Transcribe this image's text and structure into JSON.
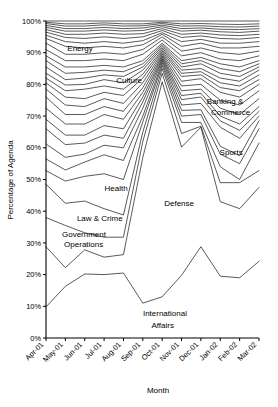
{
  "chart_data": {
    "type": "area",
    "title": "",
    "xlabel": "Month",
    "ylabel": "Percentage of Agenda",
    "grid": false,
    "legend_position": "inline-annotations",
    "ylim": [
      0,
      100
    ],
    "ytick_labels": [
      "0%",
      "10%",
      "20%",
      "30%",
      "40%",
      "50%",
      "60%",
      "70%",
      "80%",
      "90%",
      "100%"
    ],
    "ytick_values": [
      0,
      10,
      20,
      30,
      40,
      50,
      60,
      70,
      80,
      90,
      100
    ],
    "categories": [
      "Apr-01",
      "May-01",
      "Jun-01",
      "Jul-01",
      "Aug-01",
      "Sep-01",
      "Oct-01",
      "Nov-01",
      "Dec-01",
      "Jan-02",
      "Feb-02",
      "Mar-02"
    ],
    "stacking": "cumulative-percentage",
    "annotations": [
      {
        "text": "Energy",
        "x_frac": 0.1,
        "y_pct": 90.5
      },
      {
        "text": "Culture",
        "x_frac": 0.33,
        "y_pct": 80.5
      },
      {
        "text": "Banking &",
        "x_frac": 0.755,
        "y_pct": 73.8
      },
      {
        "text": "Commerce",
        "x_frac": 0.775,
        "y_pct": 70.5
      },
      {
        "text": "Sports",
        "x_frac": 0.815,
        "y_pct": 57.8
      },
      {
        "text": "Health",
        "x_frac": 0.275,
        "y_pct": 46.5
      },
      {
        "text": "Defense",
        "x_frac": 0.555,
        "y_pct": 41.5
      },
      {
        "text": "Law & Crime",
        "x_frac": 0.145,
        "y_pct": 37.0
      },
      {
        "text": "Government",
        "x_frac": 0.075,
        "y_pct": 32.0
      },
      {
        "text": "Operations",
        "x_frac": 0.085,
        "y_pct": 28.8
      },
      {
        "text": "International",
        "x_frac": 0.455,
        "y_pct": 7.0
      },
      {
        "text": "Affairs",
        "x_frac": 0.495,
        "y_pct": 3.3
      }
    ],
    "series": [
      {
        "name": "International Affairs",
        "values": [
          9.8,
          16.3,
          20.2,
          20.0,
          20.5,
          11.0,
          13.0,
          19.8,
          28.8,
          19.5,
          19.0,
          24.2
        ]
      },
      {
        "name": "Defense (cum.)",
        "values": [
          28.8,
          22.2,
          27.8,
          25.5,
          26.3,
          57.0,
          80.8,
          60.2,
          66.5,
          43.0,
          40.8,
          47.5
        ]
      },
      {
        "name": "Government Operations (cum.)",
        "values": [
          38.0,
          35.5,
          33.2,
          31.8,
          31.8,
          62.0,
          83.5,
          64.5,
          66.8,
          49.0,
          49.0,
          52.8
        ]
      },
      {
        "name": "Law & Crime (cum.)",
        "values": [
          48.5,
          42.5,
          43.2,
          40.8,
          38.8,
          65.0,
          85.0,
          68.0,
          68.0,
          54.0,
          50.0,
          61.5
        ]
      },
      {
        "name": "Health (cum.)",
        "values": [
          52.8,
          49.5,
          51.0,
          51.8,
          50.0,
          68.2,
          86.0,
          70.0,
          70.5,
          58.0,
          55.0,
          66.0
        ]
      },
      {
        "name": "Sports (cum.)",
        "values": [
          56.5,
          53.0,
          55.5,
          57.8,
          56.0,
          70.0,
          86.8,
          71.8,
          72.0,
          60.5,
          57.5,
          68.5
        ]
      },
      {
        "name": "Banking & Commerce (cum.)",
        "values": [
          61.2,
          57.0,
          58.0,
          60.8,
          60.0,
          72.5,
          87.5,
          73.5,
          74.0,
          66.5,
          63.0,
          70.0
        ]
      },
      {
        "name": "Series 8",
        "values": [
          66.0,
          61.0,
          61.5,
          64.0,
          63.0,
          74.5,
          88.0,
          75.2,
          76.0,
          68.5,
          65.5,
          71.5
        ]
      },
      {
        "name": "Series 9",
        "values": [
          69.0,
          64.0,
          64.0,
          67.0,
          66.0,
          76.0,
          88.5,
          76.5,
          77.2,
          70.0,
          67.5,
          73.0
        ]
      },
      {
        "name": "Series 10",
        "values": [
          72.5,
          67.5,
          67.5,
          70.5,
          69.0,
          77.5,
          89.0,
          78.0,
          78.5,
          72.5,
          70.5,
          75.5
        ]
      },
      {
        "name": "Series 11",
        "values": [
          76.0,
          70.5,
          70.5,
          73.0,
          71.5,
          79.0,
          89.5,
          79.5,
          80.0,
          75.0,
          73.5,
          78.0
        ]
      },
      {
        "name": "Series 12",
        "values": [
          78.5,
          73.5,
          73.0,
          75.5,
          74.0,
          80.5,
          90.0,
          81.0,
          81.8,
          77.5,
          76.0,
          80.0
        ]
      },
      {
        "name": "Culture (cum.)",
        "values": [
          80.5,
          76.0,
          75.5,
          77.5,
          76.5,
          82.0,
          90.5,
          82.5,
          83.0,
          79.0,
          78.0,
          81.5
        ]
      },
      {
        "name": "Series 14",
        "values": [
          82.0,
          78.0,
          78.5,
          79.5,
          78.5,
          83.2,
          91.0,
          83.5,
          84.0,
          80.5,
          79.5,
          83.0
        ]
      },
      {
        "name": "Series 15",
        "values": [
          83.5,
          79.8,
          80.0,
          81.5,
          80.5,
          84.5,
          91.5,
          84.5,
          85.0,
          82.0,
          81.0,
          84.5
        ]
      },
      {
        "name": "Series 16",
        "values": [
          85.5,
          81.5,
          82.0,
          83.0,
          82.5,
          85.5,
          92.0,
          85.5,
          86.5,
          83.5,
          82.5,
          85.5
        ]
      },
      {
        "name": "Energy (cum.)",
        "values": [
          87.5,
          83.5,
          83.8,
          84.5,
          84.0,
          86.5,
          92.5,
          86.5,
          87.5,
          85.0,
          84.0,
          86.5
        ]
      },
      {
        "name": "Series 18",
        "values": [
          89.0,
          85.5,
          85.5,
          86.0,
          85.5,
          87.5,
          93.0,
          87.5,
          88.5,
          86.5,
          85.5,
          87.5
        ]
      },
      {
        "name": "Series 19",
        "values": [
          91.0,
          87.5,
          87.5,
          88.0,
          87.5,
          89.5,
          94.0,
          89.0,
          90.0,
          88.0,
          87.5,
          89.0
        ]
      },
      {
        "name": "Series 20",
        "values": [
          93.0,
          89.5,
          89.5,
          90.0,
          89.5,
          91.0,
          95.0,
          90.5,
          91.5,
          90.0,
          89.5,
          90.5
        ]
      },
      {
        "name": "Series 21",
        "values": [
          94.5,
          92.0,
          91.5,
          92.0,
          91.5,
          92.5,
          95.8,
          92.0,
          93.0,
          91.5,
          91.5,
          92.0
        ]
      },
      {
        "name": "Series 22",
        "values": [
          95.5,
          93.5,
          93.0,
          93.5,
          93.0,
          93.8,
          96.3,
          93.5,
          94.2,
          93.0,
          93.0,
          93.5
        ]
      },
      {
        "name": "Series 23",
        "values": [
          96.5,
          94.8,
          94.5,
          95.0,
          94.5,
          95.0,
          97.0,
          94.8,
          95.3,
          94.5,
          94.3,
          94.8
        ]
      },
      {
        "name": "Series 24",
        "values": [
          97.3,
          95.8,
          95.8,
          96.2,
          95.8,
          96.0,
          97.6,
          95.8,
          96.2,
          95.6,
          95.4,
          95.8
        ]
      },
      {
        "name": "Series 25",
        "values": [
          98.0,
          96.8,
          96.8,
          97.2,
          96.8,
          97.0,
          98.2,
          96.8,
          97.1,
          96.6,
          96.4,
          96.8
        ]
      },
      {
        "name": "Series 26",
        "values": [
          98.6,
          97.6,
          97.6,
          98.0,
          97.6,
          97.8,
          98.7,
          97.6,
          97.8,
          97.4,
          97.3,
          97.6
        ]
      },
      {
        "name": "Series 27",
        "values": [
          99.2,
          98.4,
          98.4,
          98.8,
          98.4,
          98.5,
          99.2,
          98.4,
          98.5,
          98.2,
          98.1,
          98.4
        ]
      },
      {
        "name": "Series 28",
        "values": [
          99.6,
          99.1,
          99.1,
          99.4,
          99.1,
          99.1,
          99.6,
          99.1,
          99.2,
          99.0,
          98.9,
          99.1
        ]
      },
      {
        "name": "Total",
        "values": [
          100,
          100,
          100,
          100,
          100,
          100,
          100,
          100,
          100,
          100,
          100,
          100
        ]
      }
    ]
  }
}
